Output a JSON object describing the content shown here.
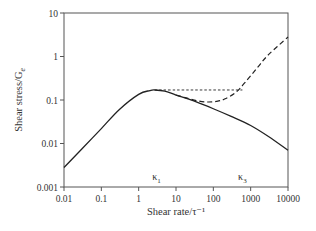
{
  "chart_data": {
    "type": "line",
    "title": "",
    "xlabel": "Shear rate/τ⁻¹",
    "ylabel": "Shear stress/G",
    "ylabel_subscript": "e",
    "xscale": "log",
    "yscale": "log",
    "xlim": [
      0.01,
      10000
    ],
    "ylim": [
      0.001,
      10
    ],
    "x_ticks": [
      "0.01",
      "0.1",
      "1",
      "10",
      "100",
      "1000",
      "10000"
    ],
    "y_ticks": [
      "0.001",
      "0.01",
      "0.1",
      "1",
      "10"
    ],
    "grid": false,
    "legend": null,
    "annotations": [
      {
        "text": "κ",
        "sub": "1",
        "x": 3,
        "y": 0.0013
      },
      {
        "text": "κ",
        "sub": "3",
        "x": 600,
        "y": 0.0013
      }
    ],
    "series": [
      {
        "name": "solid-flow-curve",
        "style": "solid",
        "x": [
          0.01,
          0.03,
          0.1,
          0.3,
          1,
          2,
          2.7,
          5,
          10,
          30,
          100,
          300,
          1000,
          3000,
          10000
        ],
        "y": [
          0.0028,
          0.0075,
          0.022,
          0.06,
          0.135,
          0.165,
          0.17,
          0.16,
          0.13,
          0.095,
          0.063,
          0.042,
          0.026,
          0.0145,
          0.007
        ]
      },
      {
        "name": "dashed-upturn-branch",
        "style": "dashed",
        "x": [
          10,
          20,
          40,
          70,
          120,
          200,
          400,
          700,
          1500,
          3000,
          10000
        ],
        "y": [
          0.13,
          0.11,
          0.095,
          0.09,
          0.093,
          0.105,
          0.15,
          0.25,
          0.55,
          1.1,
          2.8
        ]
      },
      {
        "name": "dotted-plateau-line",
        "style": "dotted",
        "x": [
          2.7,
          600
        ],
        "y": [
          0.17,
          0.17
        ]
      }
    ]
  }
}
